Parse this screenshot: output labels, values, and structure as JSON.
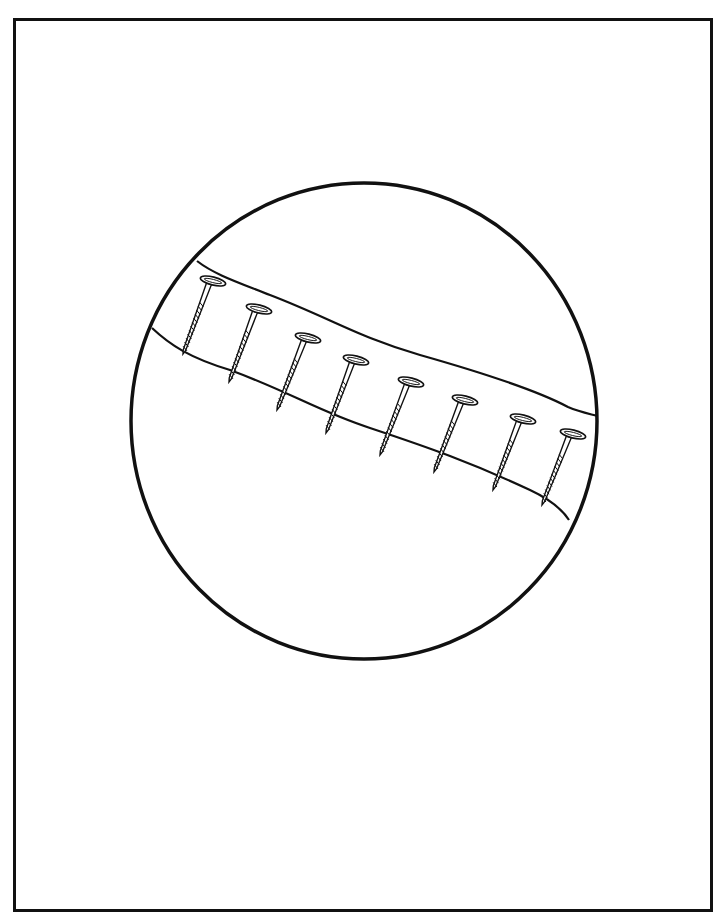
{
  "page": {
    "line_color": "#111111",
    "background_color": "#ffffff"
  },
  "nails": {
    "count": 8
  }
}
